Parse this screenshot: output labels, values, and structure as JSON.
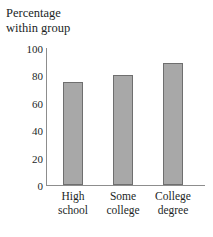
{
  "chart_data": {
    "type": "bar",
    "title": "",
    "ylabel": "Percentage within group",
    "ylabel_lines": [
      "Percentage",
      "within group"
    ],
    "xlabel": "",
    "categories": [
      "High school",
      "Some college",
      "College degree"
    ],
    "category_lines": [
      [
        "High",
        "school"
      ],
      [
        "Some",
        "college"
      ],
      [
        "College",
        "degree"
      ]
    ],
    "values": [
      76,
      81,
      90
    ],
    "ylim": [
      0,
      100
    ],
    "yticks": [
      0,
      20,
      40,
      60,
      80,
      100
    ],
    "ytick_labels": [
      "0",
      "20",
      "40",
      "60",
      "80",
      "100"
    ],
    "grid": false,
    "legend": "none",
    "bar_color": "#a8a8a8",
    "bar_border_color": "#6f6f6f",
    "axis_color": "#8d8d8d",
    "background": "#ffffff",
    "text_color": "#221f1f"
  }
}
